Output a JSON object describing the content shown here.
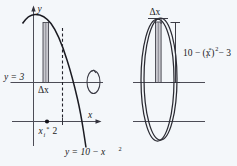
{
  "figure": {
    "background_color": "#f4f7fa",
    "ink_color": "#1b1b22",
    "shade_color": "#c9c9cf",
    "left_panel": {
      "name": "region-panel",
      "axis_labels": {
        "y_axis": "y",
        "x_axis": "x"
      },
      "labels": {
        "horizontal_line": "y = 3",
        "delta_x": "Δx",
        "sample_point": "x",
        "sample_point_sub": "i",
        "sample_point_sup": "*",
        "x_tick": "2",
        "curve_equation_lhs": "y = 10 − x",
        "curve_equation_exp": "2"
      },
      "curve": {
        "equation": "y = 10 - x^2",
        "type": "parabola",
        "vertex_x": 0,
        "vertex_y": 10,
        "x_intercept": 3.1623
      },
      "horizontal_line": {
        "equation": "y = 3",
        "y_value": 3
      },
      "rectangle": {
        "label": "Δx",
        "at_x": "x_i*",
        "width_meaning": "delta x",
        "bottom_y": 3,
        "top_equation": "10 - (x_i*)^2"
      },
      "axis_of_revolution": "vertical line x = 2",
      "rotation_indicator": "revolution-arrow"
    },
    "right_panel": {
      "name": "shell-panel",
      "labels": {
        "delta_x": "Δx",
        "height_lhs": "10 − (x",
        "height_sub": "i",
        "height_sup_star": "*",
        "height_close_exp": "2",
        "height_rhs": "− 3",
        "height_full": "10 − (xᵢ*)² − 3"
      },
      "shell": {
        "shape": "cylindrical-shell",
        "rendered_as": "double ellipse",
        "height_expression": "10 - (x_i*)^2 - 3"
      }
    }
  }
}
